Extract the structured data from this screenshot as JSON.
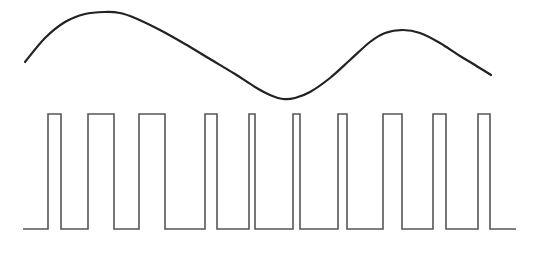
{
  "diagram": {
    "type": "pwm-modulation",
    "colors": {
      "background": "#ffffff",
      "sine_stroke": "#222222",
      "pulse_stroke": "#555555"
    },
    "sine_wave": {
      "points": [
        [
          25,
          62
        ],
        [
          45,
          38
        ],
        [
          65,
          22
        ],
        [
          85,
          14
        ],
        [
          105,
          12
        ],
        [
          120,
          13
        ],
        [
          135,
          18
        ],
        [
          160,
          30
        ],
        [
          185,
          44
        ],
        [
          210,
          59
        ],
        [
          235,
          74
        ],
        [
          255,
          87
        ],
        [
          270,
          95
        ],
        [
          283,
          99
        ],
        [
          295,
          98
        ],
        [
          310,
          92
        ],
        [
          330,
          78
        ],
        [
          350,
          60
        ],
        [
          370,
          42
        ],
        [
          385,
          33
        ],
        [
          403,
          30
        ],
        [
          420,
          33
        ],
        [
          440,
          43
        ],
        [
          460,
          56
        ],
        [
          475,
          65
        ],
        [
          491,
          75
        ]
      ]
    },
    "pulse_train": {
      "baseline_y": 229,
      "high_y": 114,
      "start_x": 23,
      "end_x": 516,
      "pulses": [
        [
          48,
          61
        ],
        [
          88,
          114
        ],
        [
          139,
          165
        ],
        [
          205,
          217
        ],
        [
          249,
          255
        ],
        [
          293,
          300
        ],
        [
          338,
          347
        ],
        [
          383,
          402
        ],
        [
          433,
          446
        ],
        [
          478,
          490
        ]
      ]
    }
  }
}
